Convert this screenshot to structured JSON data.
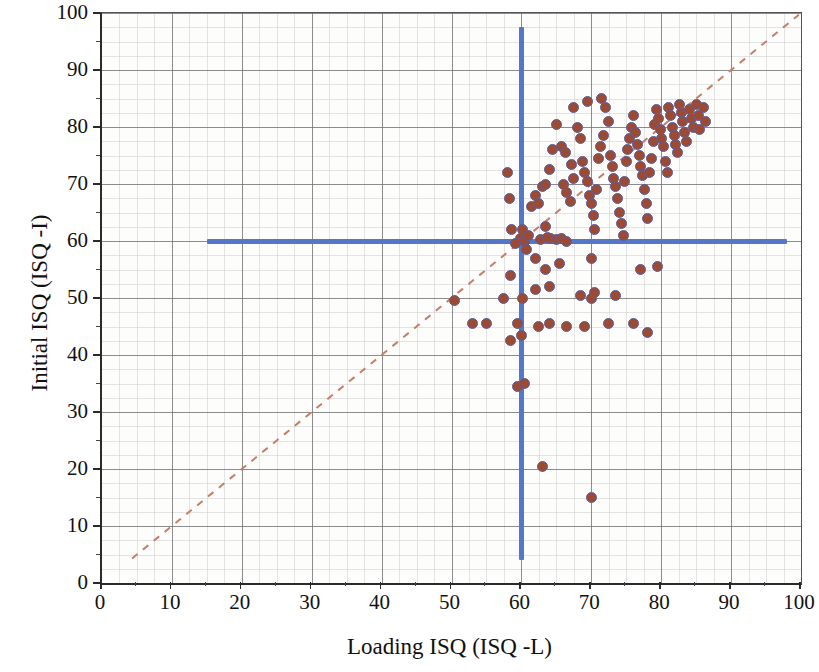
{
  "chart_data": {
    "type": "scatter",
    "title": "",
    "xlabel": "Loading ISQ (ISQ -L)",
    "ylabel": "Initial ISQ (ISQ -I)",
    "xlim": [
      0,
      100
    ],
    "ylim": [
      0,
      100
    ],
    "xticks": [
      0,
      10,
      20,
      30,
      40,
      50,
      60,
      70,
      80,
      90,
      100
    ],
    "yticks": [
      0,
      10,
      20,
      30,
      40,
      50,
      60,
      70,
      80,
      90,
      100
    ],
    "xtick_labels": [
      "0",
      "10",
      "20",
      "30",
      "40",
      "50",
      "60",
      "70",
      "80",
      "90",
      "100"
    ],
    "ytick_labels": [
      "0",
      "10",
      "20",
      "30",
      "40",
      "50",
      "60",
      "70",
      "80",
      "90",
      "100"
    ],
    "grid": true,
    "legend": null,
    "marker_fill_color": "#9c4a33",
    "marker_edge_color": "#5b5f9e",
    "marker_size_px": 11,
    "reference_lines": [
      {
        "name": "horizontal-threshold",
        "orientation": "horizontal",
        "value": 60,
        "x_start": 15,
        "x_end": 98,
        "color": "#5577c8",
        "style": "solid",
        "width_px": 5
      },
      {
        "name": "vertical-threshold",
        "orientation": "vertical",
        "value": 60,
        "y_start": 4,
        "y_end": 97.5,
        "color": "#5577c8",
        "style": "solid",
        "width_px": 5
      }
    ],
    "identity_line": {
      "name": "identity-line",
      "equation": "y = x",
      "x_start": 4.3,
      "y_start": 4.3,
      "x_end": 99.7,
      "y_end": 99.7,
      "color": "#cc7a63",
      "style": "dashed"
    },
    "points": [
      [
        58.0,
        72.0
      ],
      [
        58.3,
        67.5
      ],
      [
        60.2,
        62.0
      ],
      [
        58.6,
        62.0
      ],
      [
        62.0,
        68.0
      ],
      [
        61.5,
        66.0
      ],
      [
        62.5,
        66.5
      ],
      [
        63.0,
        69.5
      ],
      [
        63.4,
        70.0
      ],
      [
        64.0,
        72.5
      ],
      [
        64.5,
        76.0
      ],
      [
        65.0,
        80.5
      ],
      [
        65.8,
        76.5
      ],
      [
        66.3,
        75.5
      ],
      [
        66.0,
        70.0
      ],
      [
        66.5,
        68.5
      ],
      [
        67.0,
        67.0
      ],
      [
        67.5,
        71.0
      ],
      [
        67.2,
        73.5
      ],
      [
        68.0,
        80.0
      ],
      [
        68.5,
        78.0
      ],
      [
        68.8,
        74.0
      ],
      [
        69.0,
        72.0
      ],
      [
        69.4,
        70.5
      ],
      [
        69.8,
        68.0
      ],
      [
        70.0,
        66.5
      ],
      [
        70.3,
        64.5
      ],
      [
        70.5,
        62.0
      ],
      [
        70.8,
        69.0
      ],
      [
        71.0,
        74.5
      ],
      [
        71.3,
        76.5
      ],
      [
        71.8,
        78.5
      ],
      [
        72.0,
        83.5
      ],
      [
        72.4,
        81.0
      ],
      [
        72.8,
        75.0
      ],
      [
        73.0,
        73.0
      ],
      [
        73.2,
        71.0
      ],
      [
        73.5,
        69.5
      ],
      [
        73.8,
        67.5
      ],
      [
        74.0,
        65.0
      ],
      [
        74.3,
        63.0
      ],
      [
        74.6,
        61.0
      ],
      [
        74.8,
        70.5
      ],
      [
        75.0,
        74.0
      ],
      [
        75.2,
        76.0
      ],
      [
        75.5,
        78.0
      ],
      [
        75.8,
        80.0
      ],
      [
        76.0,
        82.0
      ],
      [
        76.3,
        79.0
      ],
      [
        76.6,
        77.0
      ],
      [
        76.9,
        75.0
      ],
      [
        77.0,
        73.0
      ],
      [
        77.3,
        71.5
      ],
      [
        77.6,
        69.0
      ],
      [
        77.9,
        66.5
      ],
      [
        78.0,
        64.0
      ],
      [
        78.3,
        72.0
      ],
      [
        78.6,
        74.5
      ],
      [
        78.9,
        77.5
      ],
      [
        79.0,
        80.5
      ],
      [
        79.3,
        83.0
      ],
      [
        79.6,
        81.5
      ],
      [
        79.9,
        79.5
      ],
      [
        80.0,
        78.0
      ],
      [
        80.3,
        76.5
      ],
      [
        80.6,
        74.0
      ],
      [
        80.9,
        72.0
      ],
      [
        81.0,
        83.5
      ],
      [
        81.3,
        82.0
      ],
      [
        81.6,
        80.0
      ],
      [
        81.9,
        78.5
      ],
      [
        82.0,
        77.0
      ],
      [
        82.3,
        75.5
      ],
      [
        82.6,
        84.0
      ],
      [
        82.9,
        82.5
      ],
      [
        83.0,
        81.0
      ],
      [
        83.3,
        79.0
      ],
      [
        83.6,
        77.5
      ],
      [
        84.0,
        83.0
      ],
      [
        84.3,
        81.5
      ],
      [
        84.6,
        80.0
      ],
      [
        85.0,
        84.0
      ],
      [
        85.3,
        82.0
      ],
      [
        85.5,
        79.5
      ],
      [
        86.0,
        83.5
      ],
      [
        86.3,
        81.0
      ],
      [
        69.5,
        84.5
      ],
      [
        67.5,
        83.5
      ],
      [
        71.5,
        85.0
      ],
      [
        63.5,
        62.5
      ],
      [
        64.2,
        60.5
      ],
      [
        65.0,
        60.2
      ],
      [
        65.8,
        60.5
      ],
      [
        66.5,
        60.0
      ],
      [
        62.8,
        60.3
      ],
      [
        63.8,
        60.6
      ],
      [
        59.8,
        60.5
      ],
      [
        60.5,
        60.0
      ],
      [
        61.0,
        61.0
      ],
      [
        59.2,
        59.5
      ],
      [
        60.8,
        58.5
      ],
      [
        62.0,
        57.0
      ],
      [
        63.5,
        55.0
      ],
      [
        65.5,
        56.0
      ],
      [
        70.0,
        57.0
      ],
      [
        79.5,
        55.5
      ],
      [
        77.0,
        55.0
      ],
      [
        58.5,
        54.0
      ],
      [
        57.5,
        50.0
      ],
      [
        60.2,
        50.0
      ],
      [
        62.0,
        51.5
      ],
      [
        64.0,
        52.0
      ],
      [
        68.5,
        50.5
      ],
      [
        70.0,
        50.0
      ],
      [
        70.5,
        51.0
      ],
      [
        73.5,
        50.5
      ],
      [
        50.5,
        49.5
      ],
      [
        53.0,
        45.5
      ],
      [
        55.0,
        45.5
      ],
      [
        59.5,
        45.5
      ],
      [
        62.5,
        45.0
      ],
      [
        64.0,
        45.5
      ],
      [
        66.5,
        45.0
      ],
      [
        69.0,
        45.0
      ],
      [
        72.5,
        45.5
      ],
      [
        76.0,
        45.5
      ],
      [
        78.0,
        44.0
      ],
      [
        60.0,
        43.5
      ],
      [
        58.5,
        42.5
      ],
      [
        59.5,
        34.5
      ],
      [
        60.5,
        35.0
      ],
      [
        63.0,
        20.5
      ],
      [
        70.0,
        15.0
      ]
    ]
  }
}
